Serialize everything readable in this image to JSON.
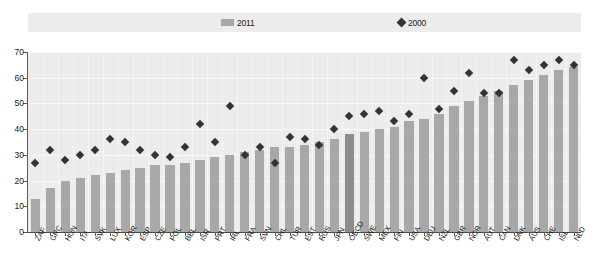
{
  "title": "",
  "legend": {
    "position": "top",
    "items": [
      {
        "label": "2011",
        "marker": "bar-swatch",
        "color": "#a8a8a8"
      },
      {
        "label": "2000",
        "marker": "diamond-marker",
        "color": "#333333"
      }
    ]
  },
  "axis": {
    "y_ticks": [
      "0",
      "10",
      "20",
      "30",
      "40",
      "50",
      "60",
      "70"
    ]
  },
  "chart_data": {
    "type": "bar",
    "title": "",
    "subtitle": "",
    "xlabel": "",
    "ylabel": "",
    "ylim": [
      0,
      70
    ],
    "ytick_step": 10,
    "grid": true,
    "legend_position": "top",
    "highlight_category": "OECD",
    "categories": [
      "ZAF",
      "GRC",
      "HUN",
      "ITA",
      "SVK",
      "LUX",
      "KOR",
      "ESP",
      "CZE",
      "POL",
      "BEL",
      "ISR",
      "PRT",
      "IRL",
      "FRA",
      "SVN",
      "CHL",
      "TUR",
      "EST",
      "RUS",
      "JPN",
      "OECD",
      "SWE",
      "MEX",
      "FIN",
      "USA",
      "DEU",
      "NZL",
      "GBR",
      "NOR",
      "AUT",
      "CAN",
      "DNK",
      "AUS",
      "CHE",
      "ISL",
      "NLD"
    ],
    "series": [
      {
        "name": "2011",
        "type": "bar",
        "color": "#a8a8a8",
        "values": [
          13,
          17,
          20,
          21,
          22,
          23,
          24,
          25,
          26,
          26,
          27,
          28,
          29,
          30,
          31,
          32,
          33,
          33,
          34,
          35,
          36,
          38,
          39,
          40,
          41,
          43,
          44,
          46,
          49,
          51,
          53,
          55,
          57,
          59,
          61,
          63,
          64
        ]
      },
      {
        "name": "2000",
        "type": "scatter",
        "color": "#333333",
        "marker": "diamond",
        "values": [
          27,
          32,
          28,
          30,
          32,
          36,
          35,
          32,
          30,
          29,
          33,
          42,
          35,
          49,
          30,
          33,
          27,
          37,
          36,
          34,
          40,
          45,
          46,
          47,
          43,
          46,
          60,
          48,
          55,
          62,
          54,
          54,
          67,
          63,
          65,
          67,
          65
        ]
      }
    ]
  }
}
